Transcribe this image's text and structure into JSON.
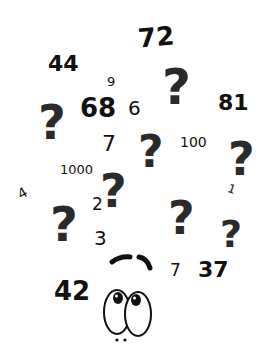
{
  "illustration": {
    "description": "Hand-drawn doodle of a confused face surrounded by question marks and numbers",
    "numbers": [
      {
        "label": "72",
        "x": 138,
        "y": 24,
        "size": 26,
        "weight": "bold",
        "rot": -5
      },
      {
        "label": "44",
        "x": 48,
        "y": 53,
        "size": 22,
        "weight": "bold",
        "rot": 0
      },
      {
        "label": "9",
        "x": 107,
        "y": 75,
        "size": 13,
        "weight": "normal",
        "rot": 0
      },
      {
        "label": "68",
        "x": 80,
        "y": 95,
        "size": 26,
        "weight": "bold",
        "rot": 0
      },
      {
        "label": "6",
        "x": 128,
        "y": 98,
        "size": 20,
        "weight": "normal",
        "rot": 0
      },
      {
        "label": "81",
        "x": 218,
        "y": 92,
        "size": 22,
        "weight": "bold",
        "rot": 0
      },
      {
        "label": "7",
        "x": 102,
        "y": 133,
        "size": 22,
        "weight": "normal",
        "rot": 0
      },
      {
        "label": "100",
        "x": 180,
        "y": 135,
        "size": 14,
        "weight": "normal",
        "rot": 0
      },
      {
        "label": "1000",
        "x": 60,
        "y": 163,
        "size": 13,
        "weight": "normal",
        "rot": 0
      },
      {
        "label": "4",
        "x": 18,
        "y": 186,
        "size": 14,
        "weight": "normal",
        "rot": -30
      },
      {
        "label": "2",
        "x": 92,
        "y": 196,
        "size": 17,
        "weight": "normal",
        "rot": 0
      },
      {
        "label": "1",
        "x": 228,
        "y": 183,
        "size": 12,
        "weight": "normal",
        "rot": 20
      },
      {
        "label": "3",
        "x": 94,
        "y": 228,
        "size": 20,
        "weight": "normal",
        "rot": 0
      },
      {
        "label": "7",
        "x": 170,
        "y": 262,
        "size": 17,
        "weight": "normal",
        "rot": 0
      },
      {
        "label": "37",
        "x": 198,
        "y": 259,
        "size": 22,
        "weight": "bold",
        "rot": 0
      },
      {
        "label": "42",
        "x": 54,
        "y": 278,
        "size": 26,
        "weight": "bold",
        "rot": 0
      }
    ],
    "question_marks": [
      {
        "x": 162,
        "y": 62,
        "size": 50
      },
      {
        "x": 38,
        "y": 98,
        "size": 48
      },
      {
        "x": 138,
        "y": 130,
        "size": 44
      },
      {
        "x": 228,
        "y": 136,
        "size": 46
      },
      {
        "x": 100,
        "y": 168,
        "size": 46
      },
      {
        "x": 50,
        "y": 200,
        "size": 48
      },
      {
        "x": 168,
        "y": 195,
        "size": 46
      },
      {
        "x": 220,
        "y": 215,
        "size": 38
      }
    ],
    "colors": {
      "ink": "#111111",
      "question_ink": "#2a2a2a",
      "background": "#ffffff"
    }
  }
}
